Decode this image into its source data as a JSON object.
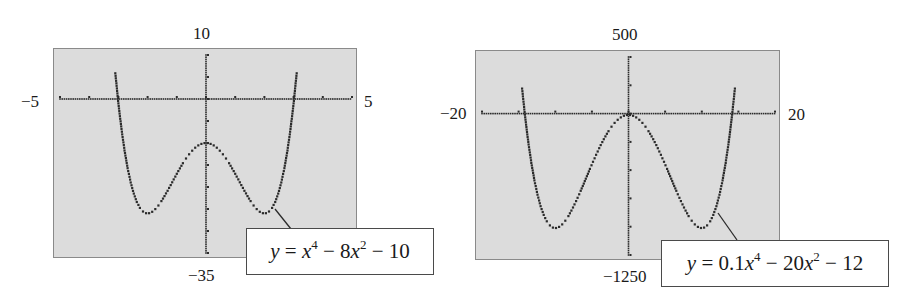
{
  "chart_data": [
    {
      "type": "line",
      "title": "",
      "equation": "y = x^4 - 8x^2 - 10",
      "equation_parts": {
        "lhs": "y",
        "eq": "=",
        "t1_var": "x",
        "t1_exp": "4",
        "op1": "−",
        "t2_coef": "8",
        "t2_var": "x",
        "t2_exp": "2",
        "op2": "−",
        "t3": "10",
        "t1_coef": ""
      },
      "coefficients": {
        "a4": 1,
        "a2": -8,
        "a0": -10
      },
      "xlim": [
        -5,
        5
      ],
      "ylim": [
        -35,
        10
      ],
      "x_tick_step": 1,
      "y_tick_step": 5,
      "window_labels": {
        "ymax": "10",
        "ymin": "−35",
        "xmin": "−5",
        "xmax": "5"
      },
      "style": "dotted",
      "grid": false
    },
    {
      "type": "line",
      "title": "",
      "equation": "y = 0.1x^4 - 20x^2 - 12",
      "equation_parts": {
        "lhs": "y",
        "eq": "=",
        "t1_coef": "0.1",
        "t1_var": "x",
        "t1_exp": "4",
        "op1": "−",
        "t2_coef": "20",
        "t2_var": "x",
        "t2_exp": "2",
        "op2": "−",
        "t3": "12"
      },
      "coefficients": {
        "a4": 0.1,
        "a2": -20,
        "a0": -12
      },
      "xlim": [
        -20,
        20
      ],
      "ylim": [
        -1250,
        500
      ],
      "x_tick_step": 5,
      "y_tick_step": 250,
      "window_labels": {
        "ymax": "500",
        "ymin": "−1250",
        "xmin": "−20",
        "xmax": "20"
      },
      "style": "dotted",
      "grid": false
    }
  ]
}
